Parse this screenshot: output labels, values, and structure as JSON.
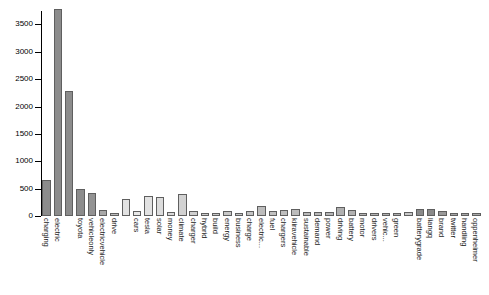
{
  "chart_data": {
    "type": "bar",
    "title": "",
    "subtitle": "",
    "xlabel": "",
    "ylabel": "",
    "ylim": [
      0,
      3800
    ],
    "grid": false,
    "legend": "none",
    "orientation": "vertical",
    "tick_label_rotation_deg": 90,
    "yticks": [
      0,
      500,
      1000,
      1500,
      2000,
      2500,
      3000,
      3500
    ],
    "ytick_labels": [
      "0",
      "500",
      "1000",
      "1500",
      "2000",
      "2500",
      "3000",
      "3500"
    ],
    "categories": [
      "charging",
      "electric",
      "",
      "toyota",
      "vehicleonly",
      "electricvehicle",
      "drive",
      "",
      "cars",
      "tesla",
      "solar",
      "money",
      "climate",
      "charger",
      "hybrid",
      "build",
      "energy",
      "business",
      "charge",
      "electric...",
      "fuel",
      "chargers",
      "kiiravehicle",
      "sustainable",
      "demand",
      "power",
      "driving",
      "battery",
      "motor",
      "drivers",
      "vehic...",
      "green",
      "",
      "batterygrade",
      "liangq",
      "brand",
      "twitter",
      "handling",
      "oppenheimer"
    ],
    "values": [
      650,
      3780,
      2290,
      490,
      420,
      110,
      60,
      310,
      100,
      360,
      350,
      70,
      410,
      100,
      60,
      55,
      100,
      55,
      100,
      180,
      100,
      110,
      120,
      80,
      80,
      80,
      160,
      105,
      55,
      55,
      60,
      60,
      75,
      130,
      130,
      95,
      60,
      55,
      50
    ],
    "bar_colors": [
      "#8c8c8c",
      "#8c8c8c",
      "#8c8c8c",
      "#8c8c8c",
      "#939393",
      "#a8a8a8",
      "#bdbdbd",
      "#e2e2e2",
      "#e8e8e8",
      "#e2e2e2",
      "#dcdcdc",
      "#d8d8d8",
      "#d2d2d2",
      "#cfcfcf",
      "#cccccc",
      "#cacaca",
      "#c8c8c8",
      "#c6c6c6",
      "#c3c3c3",
      "#bdbdbd",
      "#c0c0c0",
      "#bebebe",
      "#bcbcbc",
      "#bababa",
      "#b8b8b8",
      "#b6b6b6",
      "#b0b0b0",
      "#b2b2b2",
      "#b4b4b4",
      "#b4b4b4",
      "#b2b2b2",
      "#b0b0b0",
      "#c8c8c8",
      "#8a8a8a",
      "#8a8a8a",
      "#999999",
      "#a5a5a5",
      "#a8a8a8",
      "#aaaaaa"
    ],
    "axis_color": "#000000",
    "background_color": "#ffffff",
    "bar_border_color": "#5f5f5f"
  }
}
